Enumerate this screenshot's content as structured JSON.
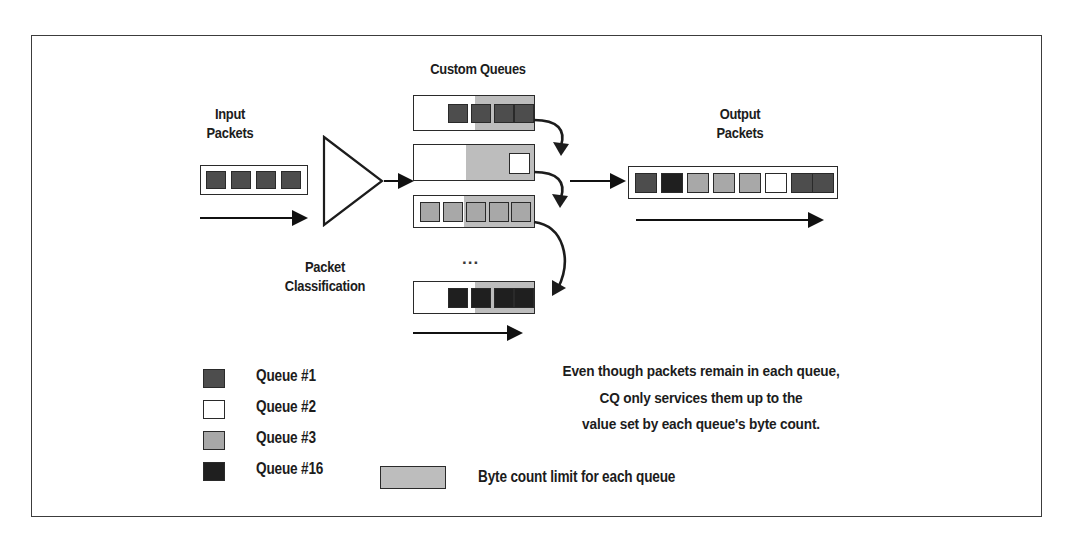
{
  "diagram": {
    "title_labels": {
      "input": "Input\nPackets",
      "input_line1": "Input",
      "input_line2": "Packets",
      "custom_queues": "Custom Queues",
      "output_line1": "Output",
      "output_line2": "Packets",
      "classification_line1": "Packet",
      "classification_line2": "Classification",
      "ellipsis": "..."
    },
    "colors": {
      "queue1": "#4d4d4d",
      "queue2": "#ffffff",
      "queue3": "#a8a8a8",
      "queue16": "#1f1f1f",
      "byte_count_band": "#bdbdbd",
      "outline": "#2a2a2a",
      "frame": "#3c3c3c"
    },
    "input_packets": {
      "count": 4,
      "packets": [
        "queue1",
        "queue1",
        "queue1",
        "queue1"
      ]
    },
    "custom_queues": [
      {
        "name": "queue-row-1",
        "queue_label": "Queue #1",
        "packet_fill": "queue1",
        "packet_count": 4,
        "packets_aligned": "right",
        "band_fraction": 0.5
      },
      {
        "name": "queue-row-2",
        "queue_label": "Queue #2",
        "packet_fill": "queue2",
        "packet_count": 1,
        "packets_aligned": "right",
        "band_fraction": 0.58
      },
      {
        "name": "queue-row-3",
        "queue_label": "Queue #3",
        "packet_fill": "queue3",
        "packet_count": 5,
        "packets_aligned": "full",
        "band_fraction": 0.58
      },
      {
        "name": "queue-row-16",
        "queue_label": "Queue #16",
        "packet_fill": "queue16",
        "packet_count": 4,
        "packets_aligned": "right",
        "band_fraction": 0.5
      }
    ],
    "output_packets": {
      "count": 8,
      "packets": [
        "queue1",
        "queue16",
        "queue3",
        "queue3",
        "queue3",
        "queue2",
        "queue1",
        "queue1"
      ]
    },
    "legend": {
      "items": [
        {
          "label": "Queue #1",
          "fill": "queue1"
        },
        {
          "label": "Queue #2",
          "fill": "queue2"
        },
        {
          "label": "Queue #3",
          "fill": "queue3"
        },
        {
          "label": "Queue #16",
          "fill": "queue16"
        }
      ],
      "byte_count": {
        "label": "Byte count limit for each queue",
        "fill": "byte_count_band"
      }
    },
    "note": {
      "line1": "Even though packets remain in each queue,",
      "line2": "CQ only services them up to the",
      "line3": "value set by each queue's byte count."
    }
  }
}
